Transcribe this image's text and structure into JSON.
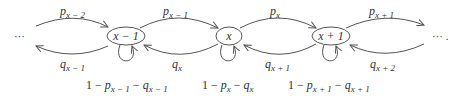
{
  "diagram": {
    "type": "birth-death Markov chain",
    "left_ellipsis": "···",
    "right_ellipsis": "··· .",
    "nodes": [
      {
        "id": "x-1",
        "label": "x − 1",
        "self_loop_label": {
          "one": "1 − ",
          "p": "p",
          "p_sub": "x − 1",
          "minus": " − ",
          "q": "q",
          "q_sub": "x − 1"
        }
      },
      {
        "id": "x",
        "label": "x",
        "self_loop_label": {
          "one": "1 − ",
          "p": "p",
          "p_sub": "x",
          "minus": " − ",
          "q": "q",
          "q_sub": "x"
        }
      },
      {
        "id": "x+1",
        "label": "x + 1",
        "self_loop_label": {
          "one": "1 − ",
          "p": "p",
          "p_sub": "x + 1",
          "minus": " − ",
          "q": "q",
          "q_sub": "x + 1"
        }
      }
    ],
    "forward_edges": [
      {
        "from": "left",
        "to": "x-1",
        "sym": "p",
        "sub": "x − 2"
      },
      {
        "from": "x-1",
        "to": "x",
        "sym": "p",
        "sub": "x − 1"
      },
      {
        "from": "x",
        "to": "x+1",
        "sym": "p",
        "sub": "x"
      },
      {
        "from": "x+1",
        "to": "right",
        "sym": "p",
        "sub": "x + 1"
      }
    ],
    "backward_edges": [
      {
        "from": "x-1",
        "to": "left",
        "sym": "q",
        "sub": "x − 1"
      },
      {
        "from": "x",
        "to": "x-1",
        "sym": "q",
        "sub": "x"
      },
      {
        "from": "x+1",
        "to": "x",
        "sym": "q",
        "sub": "x + 1"
      },
      {
        "from": "right",
        "to": "x+1",
        "sym": "q",
        "sub": "x + 2"
      }
    ],
    "colors": {
      "stroke": "#555555",
      "text": "#333333",
      "background": "#ffffff"
    }
  }
}
